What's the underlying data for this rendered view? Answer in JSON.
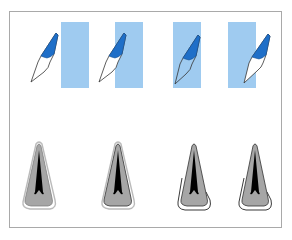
{
  "figure": {
    "colors": {
      "frame": "#a9a9a9",
      "band": "#9fcbf0",
      "enamel_blue": "#1f6fc8",
      "tooth_outline": "#333333",
      "section_gray": "#a6a6a6",
      "section_dark": "#000000",
      "outline_white": "#ffffff"
    },
    "top_row": [
      {
        "id": 1,
        "band_x": 61,
        "tooth_x": 30
      },
      {
        "id": 2,
        "band_x": 115,
        "tooth_x": 98
      },
      {
        "id": 3,
        "band_x": 173,
        "tooth_x": 174
      },
      {
        "id": 4,
        "band_x": 228,
        "tooth_x": 243
      }
    ],
    "bottom_row": [
      {
        "id": 1,
        "x": 22,
        "outline": "double-white"
      },
      {
        "id": 2,
        "x": 100,
        "outline": "double-white"
      },
      {
        "id": 3,
        "x": 177,
        "outline": "black-offset"
      },
      {
        "id": 4,
        "x": 238,
        "outline": "black-offset"
      }
    ]
  }
}
